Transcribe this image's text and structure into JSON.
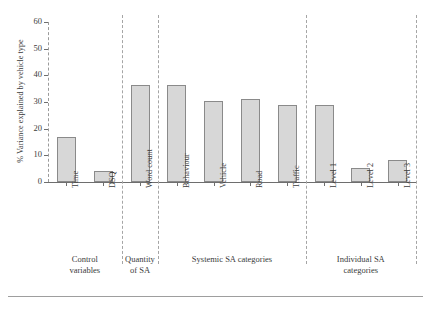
{
  "chart_data": {
    "type": "bar",
    "title": "",
    "subtitle": "",
    "xlabel": "",
    "ylabel": "% Variance explained by vehicle type",
    "ylim": [
      0,
      60
    ],
    "yticks": [
      0,
      10,
      20,
      30,
      40,
      50,
      60
    ],
    "ytick_labels": [
      "0",
      "10",
      "20",
      "30",
      "40",
      "50",
      "60"
    ],
    "grid": false,
    "legend": "none",
    "categories": [
      "Time",
      "DSQ",
      "Word count",
      "Behaviour",
      "Vehicle",
      "Road",
      "Traffic",
      "Level 1",
      "Level 2",
      "Level 3"
    ],
    "values": [
      17.0,
      4.3,
      36.4,
      36.4,
      30.5,
      31.3,
      29.0,
      29.0,
      5.3,
      8.2
    ],
    "bar_fill": "#d7d7d7",
    "bar_edge": "#8a8a8a",
    "groups": [
      {
        "label_line1": "Control",
        "label_line2": "variables",
        "members": [
          "Time",
          "DSQ"
        ]
      },
      {
        "label_line1": "Quantity",
        "label_line2": "of SA",
        "members": [
          "Word count"
        ]
      },
      {
        "label_line1": "Systemic SA categories",
        "label_line2": "",
        "members": [
          "Behaviour",
          "Vehicle",
          "Road",
          "Traffic"
        ]
      },
      {
        "label_line1": "Individual SA",
        "label_line2": "categories",
        "members": [
          "Level 1",
          "Level 2",
          "Level 3"
        ]
      }
    ]
  }
}
